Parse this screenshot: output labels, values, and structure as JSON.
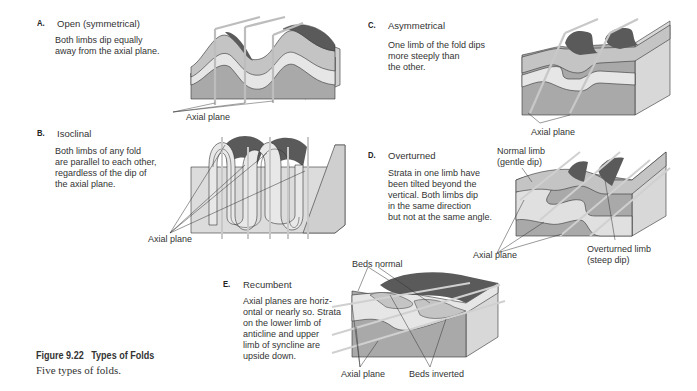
{
  "figure": {
    "number_label": "Figure 9.22",
    "title": "Types of Folds",
    "caption": "Five types of folds."
  },
  "panels": [
    {
      "letter": "A.",
      "title": "Open (symmetrical)",
      "description": "Both limbs dip equally\naway from the axial plane.",
      "labels": [
        "Axial plane"
      ]
    },
    {
      "letter": "B.",
      "title": "Isoclinal",
      "description": "Both limbs of any fold\nare parallel to each other,\nregardless of the dip of\nthe axial plane.",
      "labels": [
        "Axial plane"
      ]
    },
    {
      "letter": "C.",
      "title": "Asymmetrical",
      "description": "One limb of the fold dips\nmore steeply than\nthe other.",
      "labels": [
        "Axial plane"
      ]
    },
    {
      "letter": "D.",
      "title": "Overturned",
      "description": "Strata in one limb have\nbeen tilted beyond the\nvertical. Both limbs dip\nin the same direction\nbut not at the same angle.",
      "labels": [
        "Normal limb\n(gentle dip)",
        "Axial plane",
        "Overturned limb\n(steep dip)"
      ]
    },
    {
      "letter": "E.",
      "title": "Recumbent",
      "description": "Axial planes are horiz-\nontal or nearly so. Strata\non the lower limb of\nanticline and upper\nlimb of syncline are\nupside down.",
      "labels": [
        "Beds normal",
        "Axial plane",
        "Beds inverted"
      ]
    }
  ],
  "colors": {
    "dark_top": "#5a5a5a",
    "layer_light": "#e6e6e6",
    "layer_mid": "#c4c4c4",
    "layer_base": "#a9a9a9",
    "side_face": "#d8d8d8",
    "plane": "#f2f2f2",
    "outline": "#333333"
  }
}
